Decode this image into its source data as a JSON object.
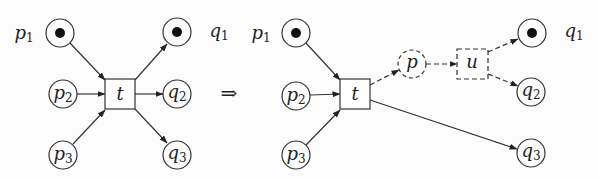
{
  "diagram": {
    "type": "petri-net-transformation",
    "implies_symbol": "⇒",
    "left_net": {
      "places": [
        {
          "id": "p1",
          "name": "p",
          "sub": "1",
          "token": true,
          "label_position": "outside-left"
        },
        {
          "id": "p2",
          "name": "p",
          "sub": "2",
          "token": false
        },
        {
          "id": "p3",
          "name": "p",
          "sub": "3",
          "token": false
        },
        {
          "id": "q1",
          "name": "q",
          "sub": "1",
          "token": true,
          "label_position": "outside-right"
        },
        {
          "id": "q2",
          "name": "q",
          "sub": "2",
          "token": false
        },
        {
          "id": "q3",
          "name": "q",
          "sub": "3",
          "token": false
        }
      ],
      "transitions": [
        {
          "id": "t",
          "name": "t"
        }
      ],
      "arcs": [
        {
          "from": "p1",
          "to": "t"
        },
        {
          "from": "p2",
          "to": "t"
        },
        {
          "from": "p3",
          "to": "t"
        },
        {
          "from": "t",
          "to": "q1"
        },
        {
          "from": "t",
          "to": "q2"
        },
        {
          "from": "t",
          "to": "q3"
        }
      ]
    },
    "right_net": {
      "places": [
        {
          "id": "p1",
          "name": "p",
          "sub": "1",
          "token": true,
          "label_position": "outside-left"
        },
        {
          "id": "p2",
          "name": "p",
          "sub": "2",
          "token": false
        },
        {
          "id": "p3",
          "name": "p",
          "sub": "3",
          "token": false
        },
        {
          "id": "p",
          "name": "p",
          "sub": "",
          "token": false,
          "dashed": true
        },
        {
          "id": "q1",
          "name": "q",
          "sub": "1",
          "token": true,
          "label_position": "outside-right"
        },
        {
          "id": "q2",
          "name": "q",
          "sub": "2",
          "token": false
        },
        {
          "id": "q3",
          "name": "q",
          "sub": "3",
          "token": false
        }
      ],
      "transitions": [
        {
          "id": "t",
          "name": "t"
        },
        {
          "id": "u",
          "name": "u",
          "dashed": true
        }
      ],
      "arcs": [
        {
          "from": "p1",
          "to": "t"
        },
        {
          "from": "p2",
          "to": "t"
        },
        {
          "from": "p3",
          "to": "t"
        },
        {
          "from": "t",
          "to": "p",
          "dashed": true
        },
        {
          "from": "p",
          "to": "u",
          "dashed": true
        },
        {
          "from": "u",
          "to": "q1",
          "dashed": true
        },
        {
          "from": "u",
          "to": "q2",
          "dashed": true
        },
        {
          "from": "t",
          "to": "q3"
        }
      ]
    }
  }
}
